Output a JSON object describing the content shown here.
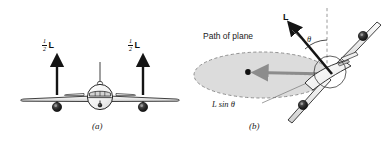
{
  "figure": {
    "type": "physics-diagram",
    "background_color": "#ffffff",
    "ink_color": "#1a1a1a",
    "fill_gray": "#d9d9d9",
    "arrow_gray": "#8c8c8c"
  },
  "panel_a": {
    "caption": "(a)",
    "left_force_label": {
      "numerator": "1",
      "denominator": "2",
      "symbol": "L"
    },
    "right_force_label": {
      "numerator": "1",
      "denominator": "2",
      "symbol": "L"
    },
    "arrow_direction": "up",
    "view": "front view of airplane, level flight"
  },
  "panel_b": {
    "caption": "(b)",
    "path_label": "Path of plane",
    "lift_label": "L",
    "angle_label": "θ",
    "horizontal_component_label": "L sin θ",
    "view": "banked airplane in a circular turn",
    "vertical_reference": "dashed",
    "path_shape": "ellipse, dashed outline, gray fill"
  }
}
